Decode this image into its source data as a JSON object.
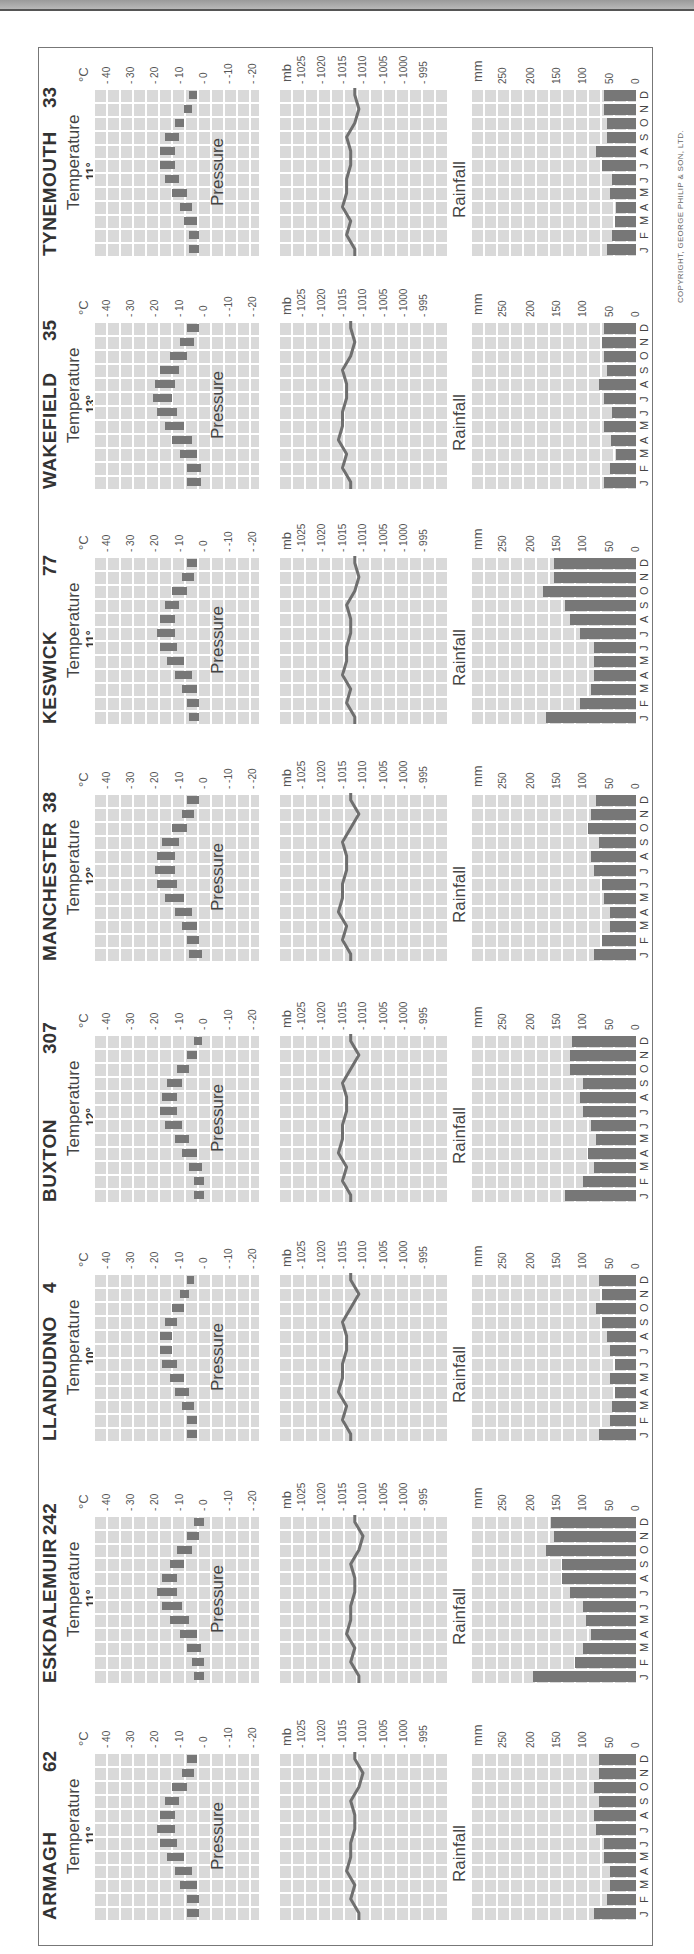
{
  "page": {
    "copyright": "COPYRIGHT, GEORGE PHILIP & SON, LTD."
  },
  "labels": {
    "temperature": "Temperature",
    "pressure": "Pressure",
    "rainfall": "Rainfall",
    "temp_unit": "°C",
    "pressure_unit": "mb",
    "rain_unit": "mm",
    "temp_ticks": [
      "40",
      "30",
      "20",
      "10",
      "0",
      "-10",
      "-20"
    ],
    "pressure_ticks": [
      "1025",
      "1020",
      "1015",
      "1010",
      "1005",
      "1000",
      "995"
    ],
    "rain_ticks": [
      "250",
      "200",
      "150",
      "100",
      "50",
      "0"
    ],
    "months": [
      "J",
      "F",
      "M",
      "A",
      "M",
      "J",
      "J",
      "A",
      "S",
      "O",
      "N",
      "D"
    ]
  },
  "chart_data": [
    {
      "type": "bar",
      "station": "TYNEMOUTH",
      "altitude_m": "33",
      "mean_temp": "11°",
      "annual_rainfall": "658 mm",
      "categories": [
        "J",
        "F",
        "M",
        "A",
        "M",
        "J",
        "J",
        "A",
        "S",
        "O",
        "N",
        "D"
      ],
      "temperature_range": [
        [
          2,
          6
        ],
        [
          2,
          6
        ],
        [
          3,
          8
        ],
        [
          5,
          10
        ],
        [
          7,
          13
        ],
        [
          10,
          16
        ],
        [
          12,
          18
        ],
        [
          12,
          18
        ],
        [
          10,
          16
        ],
        [
          8,
          12
        ],
        [
          5,
          8
        ],
        [
          3,
          6
        ]
      ],
      "pressure": [
        1012,
        1014,
        1013,
        1015,
        1014,
        1014,
        1013,
        1013,
        1014,
        1012,
        1011,
        1012
      ],
      "rainfall": [
        55,
        45,
        40,
        38,
        50,
        45,
        65,
        75,
        55,
        55,
        60,
        60
      ],
      "xlabel": "Month",
      "ylabel_temp": "°C",
      "ylabel_pressure": "mb",
      "ylabel_rain": "mm",
      "ylim_temp": [
        -20,
        40
      ],
      "ylim_pressure": [
        995,
        1025
      ],
      "ylim_rain": [
        0,
        250
      ]
    },
    {
      "type": "bar",
      "station": "WAKEFIELD",
      "altitude_m": "35",
      "mean_temp": "13°",
      "annual_rainfall": "671 mm",
      "categories": [
        "J",
        "F",
        "M",
        "A",
        "M",
        "J",
        "J",
        "A",
        "S",
        "O",
        "N",
        "D"
      ],
      "temperature_range": [
        [
          1,
          7
        ],
        [
          1,
          7
        ],
        [
          3,
          10
        ],
        [
          5,
          13
        ],
        [
          8,
          16
        ],
        [
          11,
          19
        ],
        [
          13,
          21
        ],
        [
          12,
          20
        ],
        [
          10,
          18
        ],
        [
          7,
          14
        ],
        [
          4,
          10
        ],
        [
          2,
          7
        ]
      ],
      "pressure": [
        1013,
        1015,
        1014,
        1016,
        1015,
        1015,
        1014,
        1014,
        1015,
        1013,
        1012,
        1013
      ],
      "rainfall": [
        60,
        50,
        38,
        48,
        60,
        45,
        60,
        70,
        55,
        60,
        65,
        60
      ],
      "ylim_temp": [
        -20,
        40
      ],
      "ylim_pressure": [
        995,
        1025
      ],
      "ylim_rain": [
        0,
        250
      ]
    },
    {
      "type": "bar",
      "station": "KESWICK",
      "altitude_m": "77",
      "mean_temp": "11°",
      "annual_rainfall": "1476 mm",
      "categories": [
        "J",
        "F",
        "M",
        "A",
        "M",
        "J",
        "J",
        "A",
        "S",
        "O",
        "N",
        "D"
      ],
      "temperature_range": [
        [
          2,
          6
        ],
        [
          2,
          7
        ],
        [
          3,
          9
        ],
        [
          5,
          12
        ],
        [
          8,
          15
        ],
        [
          11,
          18
        ],
        [
          12,
          19
        ],
        [
          12,
          18
        ],
        [
          10,
          16
        ],
        [
          7,
          13
        ],
        [
          4,
          9
        ],
        [
          3,
          7
        ]
      ],
      "pressure": [
        1012,
        1014,
        1013,
        1015,
        1014,
        1014,
        1013,
        1013,
        1014,
        1012,
        1011,
        1012
      ],
      "rainfall": [
        170,
        105,
        85,
        80,
        80,
        80,
        105,
        125,
        135,
        175,
        155,
        155
      ],
      "ylim_temp": [
        -20,
        40
      ],
      "ylim_pressure": [
        995,
        1025
      ],
      "ylim_rain": [
        0,
        250
      ]
    },
    {
      "type": "bar",
      "station": "MANCHESTER",
      "altitude_m": "38",
      "mean_temp": "12°",
      "annual_rainfall": "859 mm",
      "categories": [
        "J",
        "F",
        "M",
        "A",
        "M",
        "J",
        "J",
        "A",
        "S",
        "O",
        "N",
        "D"
      ],
      "temperature_range": [
        [
          1,
          6
        ],
        [
          2,
          7
        ],
        [
          3,
          9
        ],
        [
          5,
          12
        ],
        [
          8,
          16
        ],
        [
          11,
          19
        ],
        [
          12,
          20
        ],
        [
          12,
          19
        ],
        [
          10,
          17
        ],
        [
          7,
          13
        ],
        [
          4,
          9
        ],
        [
          2,
          7
        ]
      ],
      "pressure": [
        1013,
        1015,
        1014,
        1016,
        1015,
        1015,
        1014,
        1014,
        1015,
        1013,
        1011,
        1013
      ],
      "rainfall": [
        80,
        65,
        50,
        50,
        60,
        65,
        80,
        85,
        70,
        90,
        85,
        75
      ],
      "ylim_temp": [
        -20,
        40
      ],
      "ylim_pressure": [
        995,
        1025
      ],
      "ylim_rain": [
        0,
        250
      ]
    },
    {
      "type": "bar",
      "station": "BUXTON",
      "altitude_m": "307",
      "mean_temp": "12°",
      "annual_rainfall": "1232 mm",
      "categories": [
        "J",
        "F",
        "M",
        "A",
        "M",
        "J",
        "J",
        "A",
        "S",
        "O",
        "N",
        "D"
      ],
      "temperature_range": [
        [
          0,
          4
        ],
        [
          0,
          4
        ],
        [
          1,
          6
        ],
        [
          3,
          9
        ],
        [
          6,
          12
        ],
        [
          9,
          16
        ],
        [
          11,
          18
        ],
        [
          11,
          17
        ],
        [
          9,
          15
        ],
        [
          6,
          11
        ],
        [
          3,
          7
        ],
        [
          1,
          4
        ]
      ],
      "pressure": [
        1013,
        1015,
        1014,
        1016,
        1015,
        1015,
        1014,
        1014,
        1015,
        1013,
        1011,
        1013
      ],
      "rainfall": [
        135,
        100,
        80,
        90,
        75,
        85,
        100,
        105,
        100,
        125,
        125,
        120
      ],
      "ylim_temp": [
        -20,
        40
      ],
      "ylim_pressure": [
        995,
        1025
      ],
      "ylim_rain": [
        0,
        250
      ]
    },
    {
      "type": "bar",
      "station": "LLANDUDNO",
      "altitude_m": "4",
      "mean_temp": "10°",
      "annual_rainfall": "732 mm",
      "categories": [
        "J",
        "F",
        "M",
        "A",
        "M",
        "J",
        "J",
        "A",
        "S",
        "O",
        "N",
        "D"
      ],
      "temperature_range": [
        [
          3,
          7
        ],
        [
          3,
          7
        ],
        [
          4,
          9
        ],
        [
          6,
          12
        ],
        [
          8,
          14
        ],
        [
          11,
          17
        ],
        [
          13,
          18
        ],
        [
          13,
          18
        ],
        [
          11,
          16
        ],
        [
          8,
          13
        ],
        [
          6,
          10
        ],
        [
          4,
          7
        ]
      ],
      "pressure": [
        1013,
        1015,
        1014,
        1016,
        1015,
        1015,
        1014,
        1014,
        1015,
        1013,
        1011,
        1013
      ],
      "rainfall": [
        70,
        50,
        45,
        40,
        50,
        40,
        50,
        55,
        65,
        75,
        65,
        70
      ],
      "ylim_temp": [
        -20,
        40
      ],
      "ylim_pressure": [
        995,
        1025
      ],
      "ylim_rain": [
        0,
        250
      ]
    },
    {
      "type": "bar",
      "station": "ESKDALEMUIR",
      "altitude_m": "242",
      "mean_temp": "11°",
      "annual_rainfall": "1582 mm",
      "categories": [
        "J",
        "F",
        "M",
        "A",
        "M",
        "J",
        "J",
        "A",
        "S",
        "O",
        "N",
        "D"
      ],
      "temperature_range": [
        [
          0,
          4
        ],
        [
          0,
          5
        ],
        [
          1,
          7
        ],
        [
          3,
          10
        ],
        [
          6,
          14
        ],
        [
          9,
          17
        ],
        [
          11,
          19
        ],
        [
          11,
          17
        ],
        [
          8,
          14
        ],
        [
          5,
          11
        ],
        [
          2,
          7
        ],
        [
          0,
          4
        ]
      ],
      "pressure": [
        1011,
        1013,
        1012,
        1014,
        1013,
        1013,
        1012,
        1012,
        1013,
        1011,
        1010,
        1012
      ],
      "rainfall": [
        195,
        115,
        100,
        85,
        95,
        100,
        125,
        140,
        140,
        170,
        155,
        160
      ],
      "ylim_temp": [
        -20,
        40
      ],
      "ylim_pressure": [
        995,
        1025
      ],
      "ylim_rain": [
        0,
        250
      ]
    },
    {
      "type": "bar",
      "station": "ARMAGH",
      "altitude_m": "62",
      "mean_temp": "11°",
      "annual_rainfall": "846 mm",
      "categories": [
        "J",
        "F",
        "M",
        "A",
        "M",
        "J",
        "J",
        "A",
        "S",
        "O",
        "N",
        "D"
      ],
      "temperature_range": [
        [
          2,
          7
        ],
        [
          2,
          7
        ],
        [
          3,
          10
        ],
        [
          5,
          12
        ],
        [
          8,
          15
        ],
        [
          11,
          18
        ],
        [
          12,
          19
        ],
        [
          12,
          18
        ],
        [
          10,
          16
        ],
        [
          7,
          13
        ],
        [
          4,
          9
        ],
        [
          3,
          7
        ]
      ],
      "pressure": [
        1011,
        1013,
        1012,
        1014,
        1013,
        1013,
        1012,
        1012,
        1013,
        1011,
        1010,
        1012
      ],
      "rainfall": [
        80,
        55,
        50,
        50,
        60,
        60,
        75,
        80,
        70,
        80,
        70,
        70
      ],
      "ylim_temp": [
        -20,
        40
      ],
      "ylim_pressure": [
        995,
        1025
      ],
      "ylim_rain": [
        0,
        250
      ]
    }
  ]
}
